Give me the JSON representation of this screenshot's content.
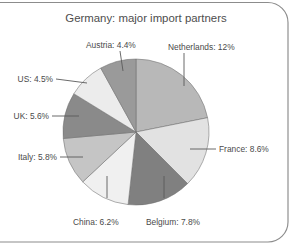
{
  "figure": {
    "title": "Germany: major import partners",
    "background_color": "#ffffff",
    "frame_color": "#8c8c8c",
    "label_color": "#4a4a4a",
    "leader_color": "#5a5a5a",
    "slice_outline_color": "#6f6f6f"
  },
  "chart_data": {
    "type": "pie",
    "title": "Germany: major import partners",
    "xlabel": "",
    "ylabel": "",
    "grid": false,
    "legend": "none",
    "value_unit": "percent",
    "value_suffix": "%",
    "start_angle_deg": 0,
    "direction": "clockwise",
    "note": "Slice angles are proportional to the listed percentages; percentages sum to 54.9 and fill the full circle.",
    "total_listed_percent": 54.9,
    "categories": [
      "Netherlands",
      "France",
      "Belgium",
      "China",
      "Italy",
      "UK",
      "US",
      "Austria"
    ],
    "values": [
      12,
      8.6,
      7.8,
      6.2,
      5.8,
      5.6,
      4.5,
      4.4
    ],
    "slice_colors": [
      "#b8b8b8",
      "#e2e2e2",
      "#808080",
      "#f0f0f0",
      "#c5c5c5",
      "#8a8a8a",
      "#ececec",
      "#9a9a9a"
    ],
    "labels": [
      {
        "name": "Netherlands",
        "value": 12,
        "text": "Netherlands: 12%",
        "color": "#b8b8b8"
      },
      {
        "name": "France",
        "value": 8.6,
        "text": "France: 8.6%",
        "color": "#e2e2e2"
      },
      {
        "name": "Belgium",
        "value": 7.8,
        "text": "Belgium: 7.8%",
        "color": "#808080"
      },
      {
        "name": "China",
        "value": 6.2,
        "text": "China: 6.2%",
        "color": "#f0f0f0"
      },
      {
        "name": "Italy",
        "value": 5.8,
        "text": "Italy: 5.8%",
        "color": "#c5c5c5"
      },
      {
        "name": "UK",
        "value": 5.6,
        "text": "UK: 5.6%",
        "color": "#8a8a8a"
      },
      {
        "name": "US",
        "value": 4.5,
        "text": "US: 4.5%",
        "color": "#ececec"
      },
      {
        "name": "Austria",
        "value": 4.4,
        "text": "Austria: 4.4%",
        "color": "#9a9a9a"
      }
    ]
  },
  "labels_text": {
    "netherlands": "Netherlands: 12%",
    "france": "France: 8.6%",
    "belgium": "Belgium: 7.8%",
    "china": "China: 6.2%",
    "italy": "Italy: 5.8%",
    "uk": "UK: 5.6%",
    "us": "US: 4.5%",
    "austria": "Austria: 4.4%"
  }
}
